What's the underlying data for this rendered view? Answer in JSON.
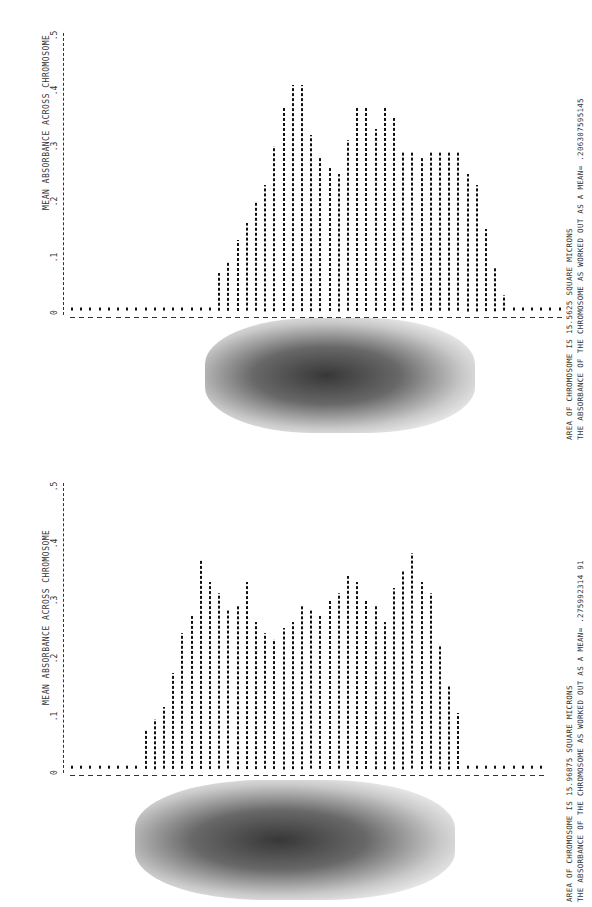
{
  "charts": [
    {
      "ylabel": "MEAN ABSORBANCE ACROSS CHROMOSOME",
      "ticks": [
        "0",
        ".1",
        ".2",
        ".3",
        ".4",
        ".5"
      ],
      "caption_line1": "AREA OF CHROMOSOME IS 15.5625 SQUARE MICRONS",
      "caption_line2": "THE ABSORBANCE OF THE CHROMOSOME AS WORKED OUT AS A MEAN= .206307595145"
    },
    {
      "ylabel": "MEAN ABSORBANCE ACROSS CHROMOSOME",
      "ticks": [
        "0",
        ".1",
        ".2",
        ".3",
        ".4",
        ".5"
      ],
      "caption_line1": "AREA OF CHROMOSOME IS 15.96875 SQUARE MICRONS",
      "caption_line2": "THE ABSORBANCE OF THE CHROMOSOME AS WORKED OUT AS A MEAN= .275992314 91"
    }
  ],
  "chart_data": [
    {
      "type": "bar",
      "title": "",
      "xlabel": "",
      "ylabel": "MEAN ABSORBANCE ACROSS CHROMOSOME",
      "ylim": [
        0,
        0.5
      ],
      "yticks": [
        0,
        0.1,
        0.2,
        0.3,
        0.4,
        0.5
      ],
      "grid": false,
      "annotations": [
        "AREA OF CHROMOSOME IS 15.5625 SQUARE MICRONS",
        "THE ABSORBANCE OF THE CHROMOSOME AS WORKED OUT AS A MEAN= .206307595145"
      ],
      "values": [
        0.01,
        0.01,
        0.01,
        0.01,
        0.01,
        0.01,
        0.01,
        0.01,
        0.01,
        0.01,
        0.01,
        0.01,
        0.01,
        0.01,
        0.01,
        0.01,
        0.07,
        0.09,
        0.13,
        0.16,
        0.2,
        0.23,
        0.3,
        0.37,
        0.41,
        0.41,
        0.32,
        0.28,
        0.26,
        0.25,
        0.31,
        0.37,
        0.37,
        0.33,
        0.37,
        0.35,
        0.29,
        0.29,
        0.28,
        0.29,
        0.29,
        0.29,
        0.29,
        0.25,
        0.23,
        0.15,
        0.08,
        0.03,
        0.01,
        0.01,
        0.01,
        0.01,
        0.01,
        0.01
      ]
    },
    {
      "type": "bar",
      "title": "",
      "xlabel": "",
      "ylabel": "MEAN ABSORBANCE ACROSS CHROMOSOME",
      "ylim": [
        0,
        0.5
      ],
      "yticks": [
        0,
        0.1,
        0.2,
        0.3,
        0.4,
        0.5
      ],
      "grid": false,
      "annotations": [
        "AREA OF CHROMOSOME IS 15.96875 SQUARE MICRONS",
        "THE ABSORBANCE OF THE CHROMOSOME AS WORKED OUT AS A MEAN= .275992314 91"
      ],
      "values": [
        0.01,
        0.01,
        0.01,
        0.01,
        0.01,
        0.01,
        0.01,
        0.01,
        0.07,
        0.09,
        0.11,
        0.17,
        0.24,
        0.27,
        0.37,
        0.33,
        0.31,
        0.28,
        0.29,
        0.33,
        0.26,
        0.24,
        0.23,
        0.25,
        0.26,
        0.29,
        0.28,
        0.27,
        0.3,
        0.31,
        0.34,
        0.33,
        0.3,
        0.29,
        0.26,
        0.32,
        0.35,
        0.38,
        0.33,
        0.31,
        0.22,
        0.15,
        0.1,
        0.01,
        0.01,
        0.01,
        0.01,
        0.01,
        0.01,
        0.01,
        0.01,
        0.01
      ]
    }
  ]
}
